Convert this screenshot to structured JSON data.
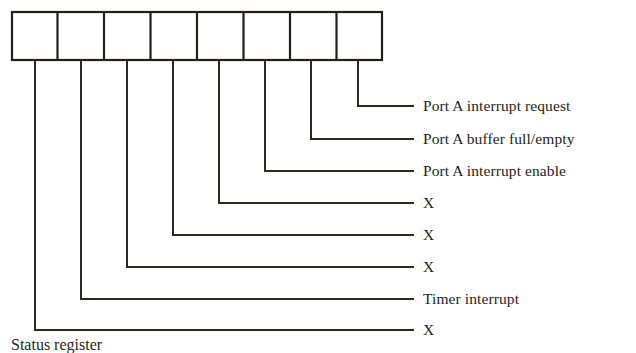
{
  "figure": {
    "title": "Status register",
    "register": {
      "name": "status-register",
      "bit_count": 8,
      "cells": [
        "",
        "",
        "",
        "",
        "",
        "",
        "",
        ""
      ],
      "box": {
        "x": 11,
        "y": 11,
        "width": 372,
        "height": 50
      },
      "border_color": "#231f1c",
      "fill_color": "#ffffff"
    },
    "leader_lines": {
      "color": "#2e2724",
      "width": 2,
      "drop_x": [
        35,
        81,
        127,
        173,
        219,
        265,
        311,
        358
      ],
      "corner_y": [
        330,
        299,
        267,
        235,
        203,
        171,
        139,
        106
      ],
      "right_end_x": 413
    },
    "bit_labels": [
      {
        "bit": 7,
        "text": "X",
        "y": 330
      },
      {
        "bit": 6,
        "text": "Timer interrupt",
        "y": 299
      },
      {
        "bit": 5,
        "text": "X",
        "y": 267
      },
      {
        "bit": 4,
        "text": "X",
        "y": 235
      },
      {
        "bit": 3,
        "text": "X",
        "y": 203
      },
      {
        "bit": 2,
        "text": "Port A interrupt enable",
        "y": 171
      },
      {
        "bit": 1,
        "text": "Port A buffer full/empty",
        "y": 139
      },
      {
        "bit": 0,
        "text": "Port A interrupt request",
        "y": 106
      }
    ],
    "label_x": 423,
    "caption": {
      "text": "Status register",
      "x": 11,
      "y": 337
    }
  }
}
